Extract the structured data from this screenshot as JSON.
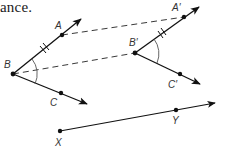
{
  "caption": "ance.",
  "colors": {
    "line": "#111111",
    "dash": "#222222",
    "arc": "#555555",
    "label": "#333333"
  },
  "labels": {
    "A": "A",
    "B": "B",
    "C": "C",
    "A_prime": "A′",
    "B_prime": "B′",
    "C_prime": "C′",
    "X": "X",
    "Y": "Y"
  },
  "points": {
    "A": [
      62,
      35
    ],
    "B": [
      13,
      74
    ],
    "C": [
      61,
      93
    ],
    "A_prime": [
      184,
      17
    ],
    "B_prime": [
      135,
      53
    ],
    "C_prime": [
      180,
      74
    ],
    "X": [
      60,
      131
    ],
    "Y": [
      176,
      110
    ]
  },
  "rays": [
    {
      "name": "ray-BA",
      "from": "B",
      "through": "A",
      "tip": [
        81,
        19
      ]
    },
    {
      "name": "ray-BC",
      "from": "B",
      "through": "C",
      "tip": [
        87,
        104
      ]
    },
    {
      "name": "ray-BpAp",
      "from": "B_prime",
      "through": "A_prime",
      "tip": [
        199,
        7
      ]
    },
    {
      "name": "ray-BpCp",
      "from": "B_prime",
      "through": "C_prime",
      "tip": [
        200,
        84
      ]
    },
    {
      "name": "ray-XY",
      "from": "X",
      "through": "Y",
      "tip": [
        215,
        103
      ]
    }
  ],
  "dashed_segments": [
    {
      "name": "translation-A",
      "from": "A",
      "to": "A_prime"
    },
    {
      "name": "translation-B",
      "from": "B",
      "to": "B_prime"
    }
  ],
  "congruence_marks": [
    "BA double tick",
    "B′A′ double tick",
    "angle B arc",
    "angle B′ arc"
  ]
}
